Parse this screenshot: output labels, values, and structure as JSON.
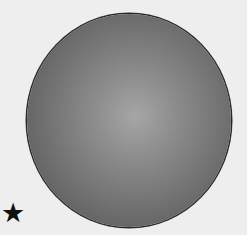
{
  "figure": {
    "star_glyph": "★",
    "colors": {
      "background": "#eeeeee",
      "sphere_highlight": "#a6a6a6",
      "sphere_edge": "#4a4a4a",
      "outline": "#2a2a2a",
      "star": "#111111"
    }
  }
}
